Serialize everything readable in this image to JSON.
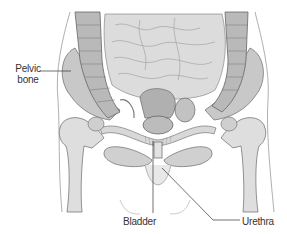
{
  "figure": {
    "type": "anatomical-illustration",
    "colors": {
      "background": "#ffffff",
      "ink": "#555555",
      "fill_light": "#e6e6e6",
      "fill_mid": "#cfcfcf",
      "fill_dark": "#a8a8a8"
    }
  },
  "labels": {
    "pelvic_bone_line1": "Pelvic",
    "pelvic_bone_line2": "bone",
    "bladder": "Bladder",
    "urethra": "Urethra"
  }
}
